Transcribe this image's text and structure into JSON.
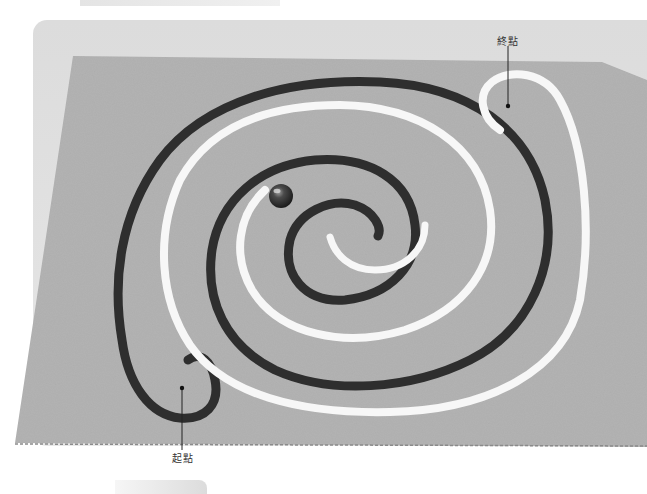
{
  "photo": {
    "subject": "spiral rope maze on cardboard with marble",
    "colors": {
      "background": "#ffffff",
      "frame": "#dedede",
      "cardboard": "#b3b3b3",
      "dark_rope": "#2e2e2e",
      "white_rope": "#f7f7f7",
      "marble": "#3a3a3a"
    }
  },
  "labels": {
    "end": "終點",
    "start": "起點"
  }
}
